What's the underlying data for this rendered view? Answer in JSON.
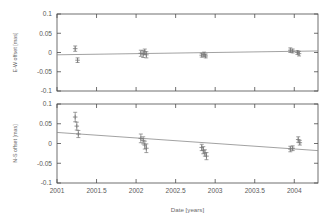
{
  "figure": {
    "background": "#ffffff",
    "frame_color": "#4d4d4d",
    "data_color": "#777777",
    "fit_color": "#8a8a8a",
    "xlabel": "Date [years]",
    "xticks": [
      "2001",
      "2001.5",
      "2002",
      "2002.5",
      "2003",
      "2003.5",
      "2004"
    ],
    "xtickvals": [
      2001,
      2001.5,
      2002,
      2002.5,
      2003,
      2003.5,
      2004
    ],
    "xlim": [
      2001,
      2004.3
    ]
  },
  "chart_data": [
    {
      "type": "scatter",
      "panel": "top",
      "title": "",
      "xlabel": "",
      "ylabel": "E-W offset [mas]",
      "xlim": [
        2001,
        2004.3
      ],
      "ylim": [
        -0.1,
        0.1
      ],
      "yticks": [
        "0.1",
        "0.05",
        "0",
        "-0.05",
        "-0.1"
      ],
      "ytickvals": [
        0.1,
        0.05,
        0,
        -0.05,
        -0.1
      ],
      "grid": false,
      "legend": "none",
      "series": [
        {
          "name": "E-W offset",
          "marker": "errorbar-plus",
          "x": [
            2001.23,
            2001.26,
            2002.06,
            2002.09,
            2002.11,
            2002.13,
            2002.83,
            2002.86,
            2002.88,
            2003.95,
            2003.98,
            2004.04,
            2004.06
          ],
          "y": [
            0.01,
            -0.02,
            -0.002,
            -0.004,
            0.002,
            -0.006,
            -0.007,
            -0.005,
            -0.009,
            0.006,
            0.004,
            0.0,
            -0.003
          ],
          "yerr": [
            0.007,
            0.006,
            0.008,
            0.009,
            0.007,
            0.008,
            0.005,
            0.006,
            0.005,
            0.006,
            0.005,
            0.005,
            0.006
          ]
        }
      ],
      "fit_line": {
        "name": "linear fit",
        "x": [
          2001,
          2004.3
        ],
        "y": [
          -0.006,
          0.004
        ]
      }
    },
    {
      "type": "scatter",
      "panel": "bottom",
      "title": "",
      "xlabel": "Date [years]",
      "ylabel": "N-S offset [mas]",
      "xlim": [
        2001,
        2004.3
      ],
      "ylim": [
        -0.1,
        0.1
      ],
      "yticks": [
        "0.1",
        "0.05",
        "0",
        "-0.05",
        "-0.1"
      ],
      "ytickvals": [
        0.1,
        0.05,
        0,
        -0.05,
        -0.1
      ],
      "grid": false,
      "legend": "none",
      "series": [
        {
          "name": "N-S offset",
          "marker": "errorbar-plus",
          "x": [
            2001.23,
            2001.25,
            2001.27,
            2002.06,
            2002.09,
            2002.11,
            2002.13,
            2002.83,
            2002.85,
            2002.87,
            2002.89,
            2003.95,
            2003.98,
            2004.05,
            2004.07
          ],
          "y": [
            0.067,
            0.044,
            0.024,
            0.013,
            0.008,
            -0.004,
            -0.012,
            -0.01,
            -0.017,
            -0.024,
            -0.032,
            -0.014,
            -0.012,
            0.01,
            0.002
          ],
          "yerr": [
            0.012,
            0.01,
            0.009,
            0.011,
            0.009,
            0.01,
            0.011,
            0.008,
            0.009,
            0.008,
            0.009,
            0.007,
            0.006,
            0.007,
            0.006
          ]
        }
      ],
      "fit_line": {
        "name": "linear fit",
        "x": [
          2001,
          2004.3
        ],
        "y": [
          0.028,
          -0.018
        ]
      }
    }
  ]
}
